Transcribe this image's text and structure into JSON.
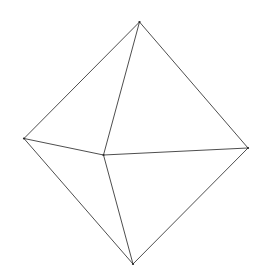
{
  "diagram": {
    "type": "wireframe-octahedron",
    "stroke_color": "#3a3a3a",
    "background": "#ffffff",
    "vertices": {
      "top": [
        139.5,
        22
      ],
      "left": [
        24,
        138.5
      ],
      "right": [
        248,
        148
      ],
      "center": [
        103.5,
        155
      ],
      "bottom": [
        133,
        264
      ]
    },
    "edges": [
      [
        "top",
        "left"
      ],
      [
        "top",
        "right"
      ],
      [
        "top",
        "center"
      ],
      [
        "left",
        "center"
      ],
      [
        "center",
        "right"
      ],
      [
        "left",
        "bottom"
      ],
      [
        "right",
        "bottom"
      ],
      [
        "center",
        "bottom"
      ]
    ]
  }
}
